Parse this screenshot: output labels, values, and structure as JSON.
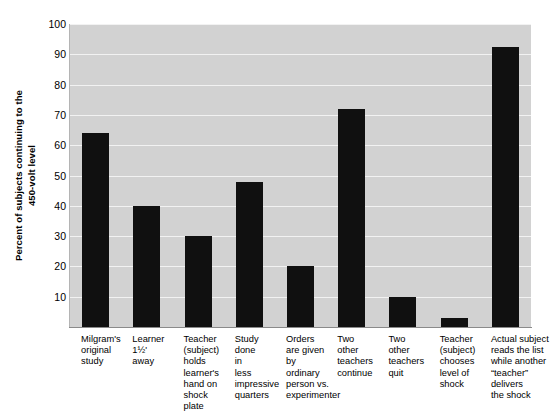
{
  "chart_data": {
    "type": "bar",
    "title": "",
    "xlabel": "",
    "ylabel": "Percent of subjects continuing to the 450-volt level",
    "ylabel_lines": [
      "Percent of subjects continuing to the",
      "450-volt level"
    ],
    "ylim": [
      0,
      100
    ],
    "yticks": [
      10,
      20,
      30,
      40,
      50,
      60,
      70,
      80,
      90,
      100
    ],
    "ytick_labels": [
      "10",
      "20",
      "30",
      "40",
      "50",
      "60",
      "70",
      "80",
      "90",
      "100"
    ],
    "grid": true,
    "legend": "none",
    "categories": [
      "Milgram's original study",
      "Learner 1½' away",
      "Teacher (subject) holds learner's hand on shock plate",
      "Study done in less impressive quarters",
      "Orders are given by ordinary person vs. experimenter",
      "Two other teachers continue",
      "Two other teachers quit",
      "Teacher (subject) chooses level of shock",
      "Actual subject reads the list while another “teacher” delivers the shock"
    ],
    "category_lines": [
      [
        "Milgram's",
        "original",
        "study"
      ],
      [
        "Learner",
        "1½'",
        "away"
      ],
      [
        "Teacher",
        "(subject)",
        "holds",
        "learner's",
        "hand on",
        "shock",
        "plate"
      ],
      [
        "Study",
        "done",
        "in",
        "less",
        "impressive",
        "quarters"
      ],
      [
        "Orders",
        "are given",
        "by",
        "ordinary",
        "person vs.",
        "experimenter"
      ],
      [
        "Two",
        "other",
        "teachers",
        "continue"
      ],
      [
        "Two",
        "other",
        "teachers",
        "quit"
      ],
      [
        "Teacher",
        "(subject)",
        "chooses",
        "level of",
        "shock"
      ],
      [
        "Actual subject",
        "reads the list",
        "while another",
        "“teacher”",
        "delivers",
        "the shock"
      ]
    ],
    "values": [
      64,
      40,
      30,
      48,
      20,
      72,
      10,
      3,
      92.5
    ],
    "bar_color": "#101010",
    "plot_background": "#d2d2d2",
    "gridline_color": "#f2f2f2",
    "axis_color": "#8a8a8a"
  }
}
